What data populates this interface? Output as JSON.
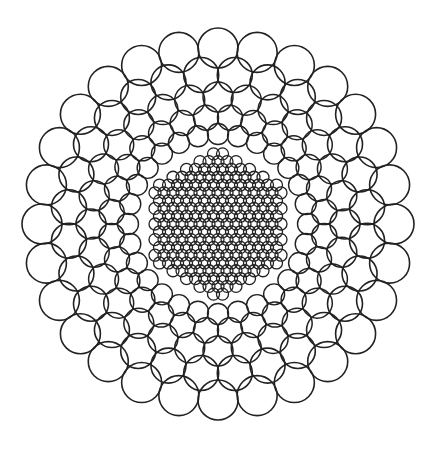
{
  "figure": {
    "width": 427,
    "height": 449,
    "background": "#ffffff",
    "stroke_color": "#222222",
    "center": [
      218,
      224
    ],
    "rings": [
      {
        "radius": 176,
        "count": 28,
        "circle_r": 20,
        "phase": 0.0,
        "stroke": 1.6
      },
      {
        "radius": 150,
        "count": 28,
        "circle_r": 17.5,
        "phase": 0.5,
        "stroke": 1.6
      },
      {
        "radius": 127,
        "count": 28,
        "circle_r": 15,
        "phase": 0.0,
        "stroke": 1.5
      },
      {
        "radius": 107,
        "count": 28,
        "circle_r": 12.5,
        "phase": 0.5,
        "stroke": 1.5
      },
      {
        "radius": 90,
        "count": 28,
        "circle_r": 10.5,
        "phase": 0.0,
        "stroke": 1.4
      }
    ],
    "core": {
      "shape": "hexagon",
      "hex_radius": 76,
      "lattice_spacing": 9,
      "circle_r": 6,
      "stroke": 1.3
    }
  }
}
